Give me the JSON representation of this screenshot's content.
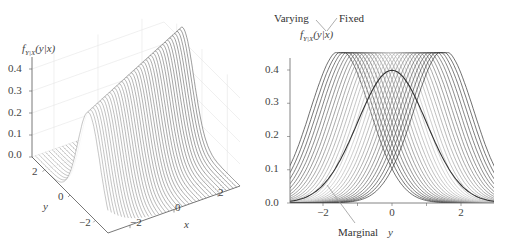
{
  "chart_data": [
    {
      "type": "surface3d",
      "title": "",
      "zlabel": "f_{Y|X}(y|x)",
      "xlabel": "x",
      "ylabel": "y",
      "x_ticks": [
        "−2",
        "0",
        "2"
      ],
      "y_ticks": [
        "2",
        "0",
        "−2"
      ],
      "z_ticks": [
        "0.0",
        "0.1",
        "0.2",
        "0.3",
        "0.4"
      ],
      "x_range": [
        -3,
        3
      ],
      "y_range": [
        -3,
        3
      ],
      "z_range": [
        0,
        0.45
      ],
      "model": "conditional normal f(y|x) = N(y; rho*x, 1-rho^2)",
      "rho": 0.5,
      "num_slices": 30,
      "grid": true
    },
    {
      "type": "line",
      "title": "",
      "xlabel": "y",
      "ylabel": "",
      "x_ticks": [
        "−2",
        "0",
        "2"
      ],
      "y_ticks": [
        "0.0",
        "0.1",
        "0.2",
        "0.3",
        "0.4"
      ],
      "xlim": [
        -3,
        3
      ],
      "ylim": [
        0,
        0.45
      ],
      "series": [
        {
          "name": "Conditional f(y|x) slices",
          "description": "30 normal curves, mean 0.5·x for x in [-3,3], sd 0.866, peak ≈0.46 (clipped at 0.45)",
          "peak_means": [
            -1.5,
            1.5
          ],
          "sd": 0.866
        },
        {
          "name": "Marginal",
          "description": "standard normal N(0,1)",
          "mean": 0,
          "sd": 1,
          "peak": 0.399
        }
      ],
      "annotations": [
        "Varying",
        "Fixed",
        "f_{Y|X}(y|x)",
        "Marginal"
      ]
    }
  ],
  "left": {
    "zlabel_main": "f",
    "zlabel_sub": "Y|X",
    "zlabel_arg": "(y|x)",
    "z_ticks": [
      "0.0",
      "0.1",
      "0.2",
      "0.3",
      "0.4"
    ],
    "y_ticks": [
      "2",
      "0",
      "−2"
    ],
    "x_ticks": [
      "−2",
      "0",
      "2"
    ],
    "xlabel": "x",
    "ylabel": "y"
  },
  "right": {
    "y_ticks": [
      "0.0",
      "0.1",
      "0.2",
      "0.3",
      "0.4"
    ],
    "x_ticks": [
      "−2",
      "0",
      "2"
    ],
    "xlabel": "y",
    "ann_varying": "Varying",
    "ann_fixed": "Fixed",
    "ann_f_main": "f",
    "ann_f_sub": "Y|X",
    "ann_f_arg": "(y|x)",
    "ann_marginal": "Marginal"
  }
}
